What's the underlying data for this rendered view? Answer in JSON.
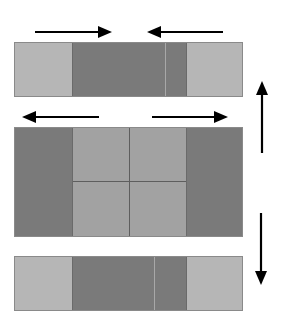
{
  "diagram": {
    "colors": {
      "background": "#ffffff",
      "light_gray": "#b6b6b6",
      "dark_gray": "#7a7a7a",
      "medium_gray": "#a2a2a2",
      "arrow": "#000000"
    },
    "top_bar": {
      "segments": [
        "light",
        "dark",
        "light"
      ],
      "arrows": [
        {
          "direction": "right",
          "from": [
            35,
            32
          ],
          "to": [
            112,
            32
          ]
        },
        {
          "direction": "left",
          "from": [
            223,
            32
          ],
          "to": [
            147,
            32
          ]
        }
      ]
    },
    "middle_block": {
      "segments": [
        "dark",
        "grid-2x2-medium",
        "dark"
      ],
      "arrows": [
        {
          "direction": "left",
          "from": [
            99,
            117
          ],
          "to": [
            22,
            117
          ]
        },
        {
          "direction": "right",
          "from": [
            152,
            117
          ],
          "to": [
            228,
            117
          ]
        }
      ]
    },
    "bottom_bar": {
      "segments": [
        "light",
        "dark",
        "light"
      ]
    },
    "side_arrows": [
      {
        "direction": "up",
        "from": [
          262,
          153
        ],
        "to": [
          262,
          81
        ]
      },
      {
        "direction": "down",
        "from": [
          261,
          213
        ],
        "to": [
          261,
          285
        ]
      }
    ]
  }
}
